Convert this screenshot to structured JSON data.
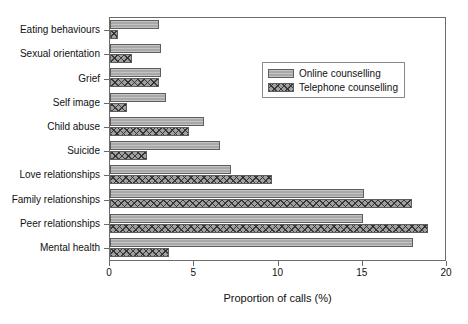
{
  "chart_data": {
    "type": "bar",
    "orientation": "horizontal",
    "title": "",
    "xlabel": "Proportion of calls (%)",
    "ylabel": "",
    "xlim": [
      0,
      20
    ],
    "xticks": [
      0,
      5,
      10,
      15,
      20
    ],
    "xtick_labels": [
      "0",
      "5",
      "10",
      "15",
      "20"
    ],
    "grid": false,
    "legend_position": "upper right",
    "categories": [
      "Eating behaviours",
      "Sexual orientation",
      "Grief",
      "Self image",
      "Child abuse",
      "Suicide",
      "Love relationships",
      "Family relationships",
      "Peer relationships",
      "Mental health"
    ],
    "series": [
      {
        "name": "Online counselling",
        "pattern": "solid-grey",
        "color": "#a8a8a8",
        "values": [
          2.9,
          3.0,
          3.0,
          3.3,
          5.6,
          6.5,
          7.2,
          15.1,
          15.0,
          18.0
        ]
      },
      {
        "name": "Telephone counselling",
        "pattern": "cross-hatch",
        "color": "#a0a0a0",
        "values": [
          0.5,
          1.3,
          2.9,
          1.0,
          4.7,
          2.2,
          9.6,
          17.9,
          18.9,
          3.5
        ]
      }
    ]
  },
  "legend": {
    "entries": [
      {
        "label": "Online counselling"
      },
      {
        "label": "Telephone counselling"
      }
    ]
  }
}
